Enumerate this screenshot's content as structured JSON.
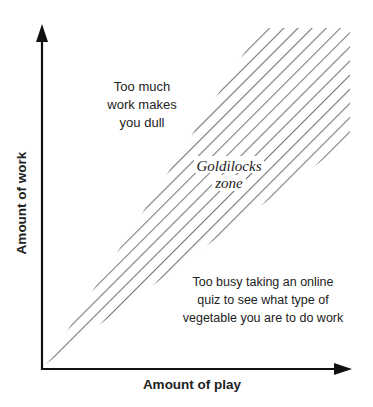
{
  "diagram": {
    "x_axis": {
      "label": "Amount of play"
    },
    "y_axis": {
      "label": "Amount of work"
    },
    "regions": {
      "upper_left": {
        "lines": [
          "Too much",
          "work makes",
          "you dull"
        ]
      },
      "middle": {
        "lines": [
          "Goldilocks",
          "zone"
        ]
      },
      "lower_right": {
        "lines": [
          "Too busy taking an online",
          "quiz to see what type of",
          "vegetable you are to do work"
        ]
      }
    },
    "colors": {
      "axis": "#111111",
      "hatch": "#7a7a7a",
      "text": "#222222"
    }
  }
}
